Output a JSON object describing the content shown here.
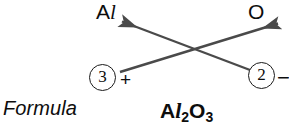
{
  "diagram": {
    "type": "criss-cross-valence-method",
    "line_color": "#4a4a4a",
    "text_color": "#0d0d0d",
    "background": "#ffffff",
    "elements": [
      {
        "id": "cation",
        "symbol_prefix": "A",
        "symbol_suffix": "l",
        "symbol_full": "Al",
        "charge_number": "3",
        "charge_sign": "+",
        "position": "left"
      },
      {
        "id": "anion",
        "symbol_prefix": "O",
        "symbol_suffix": "",
        "symbol_full": "O",
        "charge_number": "2",
        "charge_sign": "−",
        "position": "right"
      }
    ],
    "arrows": [
      {
        "name": "charge-2-to-aluminum",
        "from": "anion-charge",
        "to": "Al",
        "x1": 250,
        "y1": 70,
        "x2": 119,
        "y2": 20,
        "direction": "up-left"
      },
      {
        "name": "charge-3-to-oxygen",
        "from": "cation-charge",
        "to": "O",
        "x1": 120,
        "y1": 72,
        "x2": 281,
        "y2": 22,
        "direction": "up-right"
      }
    ]
  },
  "caption": {
    "label": "Formula"
  },
  "result": {
    "prefix": "A",
    "slant_l": "l",
    "sub1": "2",
    "element2": "O",
    "sub2": "3",
    "full_text": "Al2O3"
  }
}
